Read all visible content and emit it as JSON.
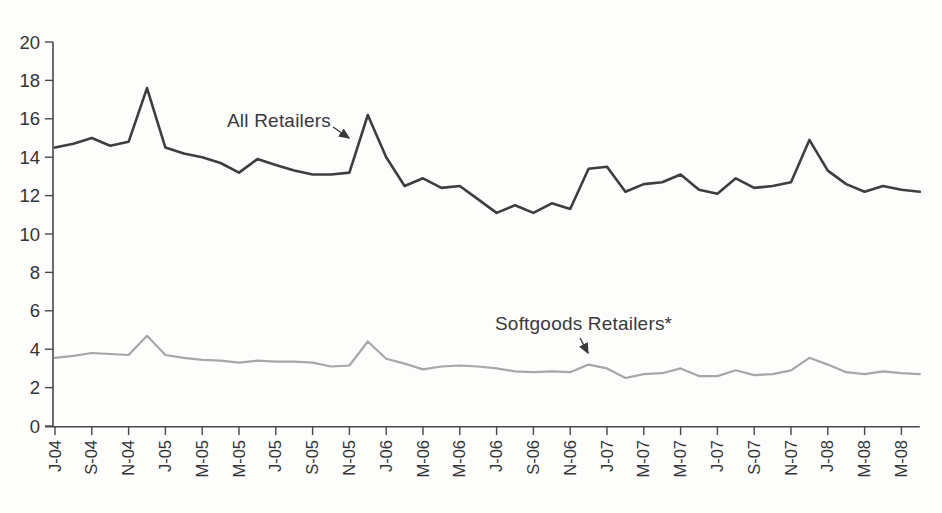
{
  "chart_data": {
    "type": "line",
    "title": "",
    "xlabel": "",
    "ylabel": "",
    "x_unit": "month",
    "x_range": "Jul-2004 to Jun-2008",
    "n_points": 48,
    "months": [
      "J-04",
      "A-04",
      "S-04",
      "O-04",
      "N-04",
      "D-04",
      "J-05",
      "F-05",
      "M-05",
      "A-05",
      "M-05",
      "J-05",
      "J-05",
      "A-05",
      "S-05",
      "O-05",
      "N-05",
      "D-05",
      "J-06",
      "F-06",
      "M-06",
      "A-06",
      "M-06",
      "J-06",
      "J-06",
      "A-06",
      "S-06",
      "O-06",
      "N-06",
      "D-06",
      "J-07",
      "F-07",
      "M-07",
      "A-07",
      "M-07",
      "J-07",
      "J-07",
      "A-07",
      "S-07",
      "O-07",
      "N-07",
      "D-07",
      "J-08",
      "F-08",
      "M-08",
      "A-08",
      "M-08",
      "J-08"
    ],
    "x_tick_labels": [
      "J-04",
      "S-04",
      "N-04",
      "J-05",
      "M-05",
      "M-05",
      "J-05",
      "S-05",
      "N-05",
      "J-06",
      "M-06",
      "M-06",
      "J-06",
      "S-06",
      "N-06",
      "J-07",
      "M-07",
      "M-07",
      "J-07",
      "S-07",
      "N-07",
      "J-08",
      "M-08",
      "M-08"
    ],
    "x_tick_month_indices": [
      0,
      2,
      4,
      6,
      8,
      10,
      12,
      14,
      16,
      18,
      20,
      22,
      24,
      26,
      28,
      30,
      32,
      34,
      36,
      38,
      40,
      42,
      44,
      46
    ],
    "yticks": [
      0,
      2,
      4,
      6,
      8,
      10,
      12,
      14,
      16,
      18,
      20
    ],
    "ylim": [
      0,
      20
    ],
    "grid": false,
    "legend_position": "inline-annotations",
    "series": [
      {
        "name": "All Retailers",
        "color": "#3e3e40",
        "stroke_width": 2.6,
        "values": [
          14.5,
          14.7,
          15.0,
          14.6,
          14.8,
          17.6,
          14.5,
          14.2,
          14.0,
          13.7,
          13.2,
          13.9,
          13.6,
          13.3,
          13.1,
          13.1,
          13.2,
          16.2,
          14.0,
          12.5,
          12.9,
          12.4,
          12.5,
          11.8,
          11.1,
          11.5,
          11.1,
          11.6,
          11.3,
          13.4,
          13.5,
          12.2,
          12.6,
          12.7,
          13.1,
          12.3,
          12.1,
          12.9,
          12.4,
          12.5,
          12.7,
          14.9,
          13.3,
          12.6,
          12.2,
          12.5,
          12.3,
          12.2
        ]
      },
      {
        "name": "Softgoods Retailers*",
        "color": "#a7a7a9",
        "stroke_width": 2.2,
        "values": [
          3.55,
          3.65,
          3.8,
          3.75,
          3.7,
          4.7,
          3.7,
          3.55,
          3.45,
          3.4,
          3.3,
          3.4,
          3.35,
          3.35,
          3.3,
          3.1,
          3.15,
          4.4,
          3.5,
          3.25,
          2.95,
          3.1,
          3.15,
          3.1,
          3.0,
          2.85,
          2.8,
          2.85,
          2.8,
          3.2,
          3.0,
          2.5,
          2.7,
          2.75,
          3.0,
          2.6,
          2.6,
          2.9,
          2.65,
          2.7,
          2.9,
          3.55,
          3.2,
          2.8,
          2.7,
          2.85,
          2.75,
          2.7
        ]
      }
    ],
    "annotations": [
      {
        "text": "All Retailers",
        "points_to": "All Retailers line just before Dec-05 peak"
      },
      {
        "text": "Softgoods Retailers*",
        "points_to": "Softgoods line local peak at Dec-06"
      }
    ],
    "axis_color": "#48484a",
    "label_color": "#343436"
  }
}
